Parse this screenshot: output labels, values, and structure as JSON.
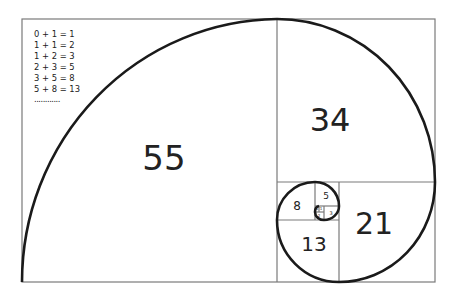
{
  "equations": [
    "0 + 1 = 1",
    "1 + 1 = 2",
    "1 + 2 = 3",
    "2 + 3 = 5",
    "3 + 5 = 8",
    "5 + 8 = 13"
  ],
  "ellipsis": "............",
  "squares": [
    {
      "label": "55"
    },
    {
      "label": "34"
    },
    {
      "label": "21"
    },
    {
      "label": "13"
    },
    {
      "label": "8"
    },
    {
      "label": "5"
    },
    {
      "label": "3"
    },
    {
      "label": "2"
    },
    {
      "label": "1"
    },
    {
      "label": "1"
    }
  ],
  "colors": {
    "frame": "#777777",
    "spiral": "#1a1a1a",
    "text": "#222222"
  }
}
